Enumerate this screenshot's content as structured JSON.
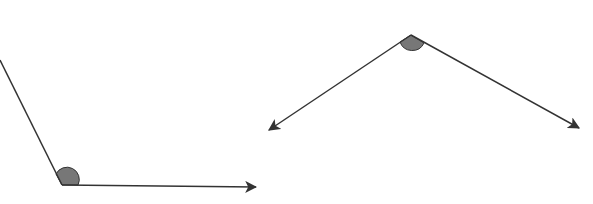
{
  "diagram": {
    "colors": {
      "line": "#333333",
      "arc_fill": "#777777",
      "arc_stroke": "#333333",
      "background": "#ffffff"
    },
    "angles": [
      {
        "name": "obtuse-angle-left",
        "vertex": [
          62,
          185
        ],
        "ray1_end": [
          0,
          60
        ],
        "ray1_arrow": false,
        "ray2_end": [
          257,
          187
        ],
        "ray2_arrow": true
      },
      {
        "name": "obtuse-angle-right",
        "vertex": [
          411,
          35
        ],
        "ray1_end": [
          268,
          130
        ],
        "ray1_arrow": true,
        "ray2_end": [
          580,
          128
        ],
        "ray2_arrow": true
      }
    ]
  }
}
